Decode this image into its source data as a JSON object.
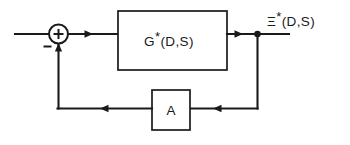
{
  "diagram": {
    "type": "control-system-block-diagram",
    "title": "",
    "background_color": "#ffffff",
    "line_color": "#1a1a1a",
    "summing_junction": {
      "name": "summing-junction",
      "plus_sign": "+",
      "minus_sign": "−"
    },
    "forward_block": {
      "name": "forward-transfer-block",
      "label_base": "G",
      "label_star": "*",
      "label_args": "(D,S)",
      "label_full": "G*(D,S)"
    },
    "feedback_block": {
      "name": "feedback-gain-block",
      "label": "A"
    },
    "output_signal": {
      "name": "output-signal-label",
      "label_base": "Ξ",
      "label_star": "*",
      "label_args": "(D,S)",
      "label_full": "Ξ*(D,S)"
    },
    "input_signal": {
      "name": "input-signal-wire",
      "label": ""
    },
    "wires": [
      "input-to-sum",
      "sum-to-forward-block",
      "forward-block-to-output-node",
      "output-node-to-output-terminal",
      "output-node-down-to-feedback",
      "feedback-right-to-A",
      "A-to-feedback-left",
      "feedback-left-up-to-sum"
    ]
  }
}
